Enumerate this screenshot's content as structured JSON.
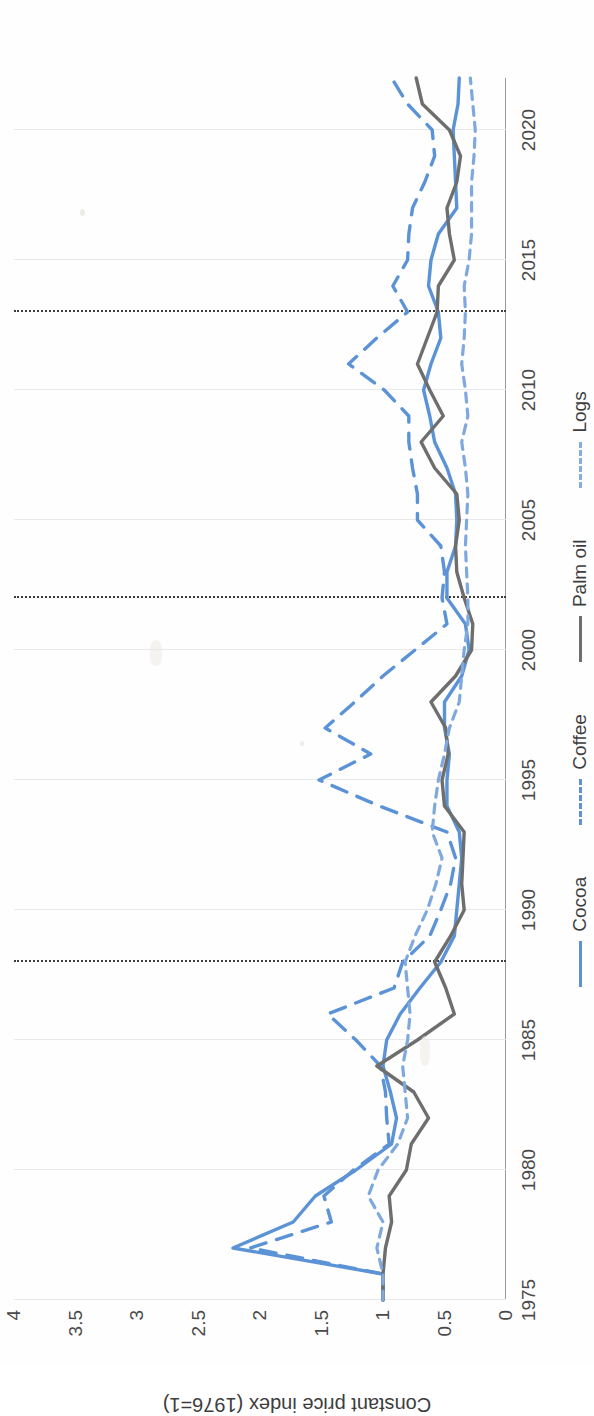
{
  "chart_data": {
    "type": "line",
    "title": "",
    "xlabel": "",
    "ylabel": "Constant price index (1976=1)",
    "xlim": [
      1975,
      2022
    ],
    "ylim": [
      0,
      4
    ],
    "xticks": [
      "1975",
      "1980",
      "1985",
      "1990",
      "1995",
      "2000",
      "2005",
      "2010",
      "2015",
      "2020"
    ],
    "yticks": [
      "0",
      "0.5",
      "1",
      "1.5",
      "2",
      "2.5",
      "3",
      "3.5",
      "4"
    ],
    "grid": "vertical-only",
    "legend_position": "bottom",
    "reference_lines": [
      1988,
      2002,
      2013
    ],
    "x": [
      1975,
      1976,
      1977,
      1978,
      1979,
      1980,
      1981,
      1982,
      1983,
      1984,
      1985,
      1986,
      1987,
      1988,
      1989,
      1990,
      1991,
      1992,
      1993,
      1994,
      1995,
      1996,
      1997,
      1998,
      1999,
      2000,
      2001,
      2002,
      2003,
      2004,
      2005,
      2006,
      2007,
      2008,
      2009,
      2010,
      2011,
      2012,
      2013,
      2014,
      2015,
      2016,
      2017,
      2018,
      2019,
      2020,
      2021,
      2022
    ],
    "series": [
      {
        "name": "Cocoa",
        "color": "#5b93d6",
        "style": "solid",
        "values": [
          1.0,
          1.0,
          2.22,
          1.73,
          1.55,
          1.22,
          0.93,
          0.89,
          0.94,
          1.0,
          0.97,
          0.86,
          0.7,
          0.53,
          0.42,
          0.4,
          0.38,
          0.36,
          0.38,
          0.48,
          0.48,
          0.46,
          0.5,
          0.5,
          0.36,
          0.3,
          0.33,
          0.48,
          0.48,
          0.41,
          0.4,
          0.41,
          0.48,
          0.58,
          0.62,
          0.67,
          0.61,
          0.53,
          0.55,
          0.63,
          0.61,
          0.55,
          0.4,
          0.41,
          0.42,
          0.43,
          0.39,
          0.38
        ]
      },
      {
        "name": "Coffee",
        "color": "#5b93d6",
        "style": "dashed",
        "values": [
          1.0,
          1.0,
          2.08,
          1.42,
          1.48,
          1.24,
          0.95,
          0.97,
          0.98,
          1.02,
          1.22,
          1.45,
          0.91,
          0.84,
          0.62,
          0.53,
          0.45,
          0.41,
          0.48,
          1.03,
          1.52,
          1.1,
          1.47,
          1.23,
          1.0,
          0.74,
          0.48,
          0.52,
          0.5,
          0.53,
          0.72,
          0.72,
          0.76,
          0.79,
          0.79,
          0.99,
          1.28,
          1.05,
          0.8,
          0.92,
          0.8,
          0.79,
          0.76,
          0.66,
          0.58,
          0.6,
          0.8,
          0.93
        ]
      },
      {
        "name": "Palm oil",
        "color": "#6e6e6e",
        "style": "solid",
        "values": [
          1.0,
          1.0,
          0.98,
          0.93,
          0.95,
          0.81,
          0.77,
          0.63,
          0.75,
          1.05,
          0.72,
          0.42,
          0.49,
          0.58,
          0.45,
          0.34,
          0.36,
          0.35,
          0.34,
          0.5,
          0.52,
          0.47,
          0.49,
          0.61,
          0.41,
          0.28,
          0.27,
          0.34,
          0.4,
          0.41,
          0.38,
          0.4,
          0.58,
          0.69,
          0.51,
          0.62,
          0.72,
          0.64,
          0.56,
          0.55,
          0.42,
          0.46,
          0.48,
          0.4,
          0.37,
          0.46,
          0.68,
          0.73
        ]
      },
      {
        "name": "Logs",
        "color": "#7fa9de",
        "style": "dotted",
        "values": [
          1.0,
          1.0,
          1.05,
          1.0,
          1.12,
          1.04,
          0.88,
          0.8,
          0.82,
          0.84,
          0.8,
          0.78,
          0.8,
          0.82,
          0.74,
          0.64,
          0.57,
          0.52,
          0.6,
          0.58,
          0.55,
          0.5,
          0.46,
          0.38,
          0.36,
          0.34,
          0.31,
          0.31,
          0.32,
          0.33,
          0.32,
          0.31,
          0.33,
          0.36,
          0.31,
          0.33,
          0.36,
          0.34,
          0.33,
          0.34,
          0.3,
          0.28,
          0.28,
          0.28,
          0.26,
          0.25,
          0.27,
          0.29
        ]
      }
    ]
  },
  "axis": {
    "y_label": "Constant price index (1976=1)"
  },
  "legend": {
    "items": [
      {
        "label": "Cocoa",
        "style": "solid",
        "color": "#5b93d6"
      },
      {
        "label": "Coffee",
        "style": "dashed",
        "color": "#5b93d6"
      },
      {
        "label": "Palm oil",
        "style": "solid",
        "color": "#6e6e6e"
      },
      {
        "label": "Logs",
        "style": "dotted",
        "color": "#7fa9de"
      }
    ]
  }
}
